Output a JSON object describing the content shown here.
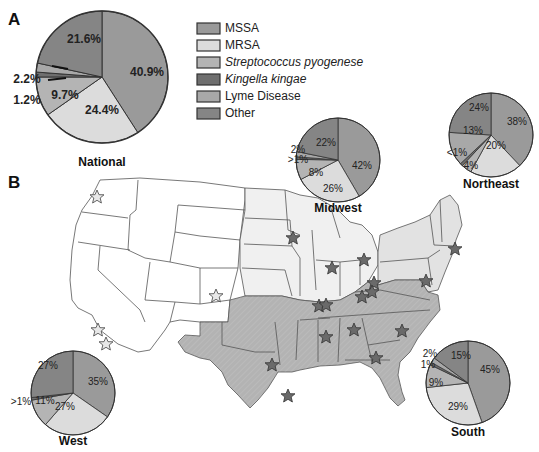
{
  "figure": {
    "panel_a_label": "A",
    "panel_b_label": "B"
  },
  "colors": {
    "MSSA": "#9a9a9a",
    "MRSA": "#dcdcdc",
    "Streptococcus pyogenese": "#b4b4b4",
    "Kingella kingae": "#6f6f6f",
    "Lyme Disease": "#a8a8a8",
    "Other": "#858585",
    "region_west": "#ffffff",
    "region_midwest": "#f0f0f0",
    "region_northeast": "#e2e2e2",
    "region_south": "#b3b3b3",
    "star_dark": "#6a6a6a",
    "star_light": "#e8e8e8"
  },
  "legend": [
    {
      "label": "MSSA",
      "italic": false
    },
    {
      "label": "MRSA",
      "italic": false
    },
    {
      "label": "Streptococcus pyogenese",
      "italic": true
    },
    {
      "label": "Kingella kingae",
      "italic": true
    },
    {
      "label": "Lyme Disease",
      "italic": false
    },
    {
      "label": "Other",
      "italic": false
    }
  ],
  "chart_data": [
    {
      "type": "pie",
      "title": "National",
      "categories": [
        "MSSA",
        "MRSA",
        "Streptococcus pyogenese",
        "Kingella kingae",
        "Lyme Disease",
        "Other"
      ],
      "values": [
        40.9,
        24.4,
        9.7,
        1.2,
        2.2,
        21.6
      ],
      "labels": [
        "40.9%",
        "24.4%",
        "9.7%",
        "1.2%",
        "2.2%",
        "21.6%"
      ]
    },
    {
      "type": "pie",
      "title": "Midwest",
      "categories": [
        "MSSA",
        "MRSA",
        "Streptococcus pyogenese",
        "Kingella kingae",
        "Lyme Disease",
        "Other"
      ],
      "values": [
        42,
        26,
        8,
        1,
        2,
        22
      ],
      "labels": [
        "42%",
        "26%",
        "8%",
        ">1%",
        "2%",
        "22%"
      ]
    },
    {
      "type": "pie",
      "title": "Northeast",
      "categories": [
        "MSSA",
        "MRSA",
        "Streptococcus pyogenese",
        "Kingella kingae",
        "Lyme Disease",
        "Other"
      ],
      "values": [
        38,
        20,
        4,
        1,
        13,
        24
      ],
      "labels": [
        "38%",
        "20%",
        "4%",
        "<1%",
        "13%",
        "24%"
      ]
    },
    {
      "type": "pie",
      "title": "West",
      "categories": [
        "MSSA",
        "MRSA",
        "Streptococcus pyogenese",
        "Kingella kingae",
        "Lyme Disease",
        "Other"
      ],
      "values": [
        35,
        27,
        11,
        1,
        0,
        27
      ],
      "labels": [
        "35%",
        "27%",
        "11%",
        ">1%",
        "",
        "27%"
      ]
    },
    {
      "type": "pie",
      "title": "South",
      "categories": [
        "MSSA",
        "MRSA",
        "Streptococcus pyogenese",
        "Kingella kingae",
        "Lyme Disease",
        "Other"
      ],
      "values": [
        45,
        29,
        9,
        1,
        2,
        15
      ],
      "labels": [
        "45%",
        "29%",
        "9%",
        "1%",
        "2%",
        "15%"
      ]
    }
  ],
  "map": {
    "regions": [
      "West",
      "Midwest",
      "Northeast",
      "South"
    ],
    "star_count": 20
  }
}
